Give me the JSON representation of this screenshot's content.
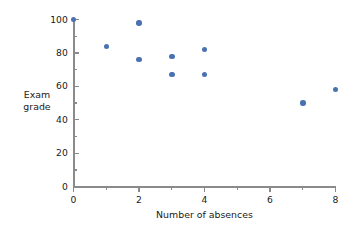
{
  "chart_data": {
    "type": "scatter",
    "title": "",
    "xlabel": "Number of absences",
    "ylabel": "Exam grade",
    "ylabel_lines": [
      "Exam",
      "grade"
    ],
    "xlim": [
      0,
      8
    ],
    "ylim": [
      0,
      100
    ],
    "grid": false,
    "legend": null,
    "marker_color": "#4a72b0",
    "axis_color": "#8a8a8a",
    "x_ticks": [
      0,
      2,
      4,
      6,
      8
    ],
    "x_tick_labels": [
      "0",
      "2",
      "4",
      "6",
      "8"
    ],
    "x_minor_ticks": [
      1,
      3,
      5,
      7
    ],
    "y_ticks": [
      0,
      20,
      40,
      60,
      80,
      100
    ],
    "y_tick_labels": [
      "0",
      "20",
      "40",
      "60",
      "80",
      "100"
    ],
    "y_minor_ticks": [
      10,
      30,
      50,
      70,
      90
    ],
    "points": [
      {
        "x": 0,
        "y": 100
      },
      {
        "x": 1,
        "y": 84
      },
      {
        "x": 2,
        "y": 98
      },
      {
        "x": 2,
        "y": 76
      },
      {
        "x": 3,
        "y": 78
      },
      {
        "x": 3,
        "y": 67
      },
      {
        "x": 4,
        "y": 82
      },
      {
        "x": 4,
        "y": 67
      },
      {
        "x": 7,
        "y": 50
      },
      {
        "x": 8,
        "y": 58
      }
    ]
  }
}
